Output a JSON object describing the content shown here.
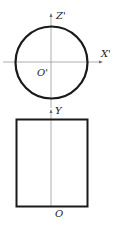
{
  "diagram": {
    "type": "orthographic-projection",
    "front_view": {
      "shape": "circle",
      "axes": {
        "vertical": "Z'",
        "horizontal": "X'",
        "origin": "O'"
      }
    },
    "top_view": {
      "shape": "rectangle",
      "axes": {
        "vertical": "Y",
        "origin": "O"
      }
    }
  },
  "colors": {
    "outline": "#1a1a1a",
    "axis": "#999999",
    "label": "#222222"
  }
}
